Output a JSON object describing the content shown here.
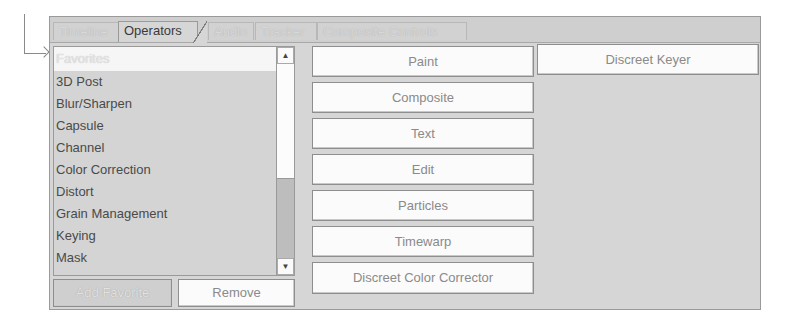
{
  "tabs": [
    {
      "label": "Timeline",
      "active": false
    },
    {
      "label": "Operators",
      "active": true
    },
    {
      "label": "Audio",
      "active": false
    },
    {
      "label": "Tracker",
      "active": false
    },
    {
      "label": "Composite Controls",
      "active": false
    }
  ],
  "category_list": {
    "header": "Favorites",
    "items": [
      "3D Post",
      "Blur/Sharpen",
      "Capsule",
      "Channel",
      "Color Correction",
      "Distort",
      "Grain Management",
      "Keying",
      "Mask"
    ]
  },
  "list_buttons": {
    "add_favorite": "Add Favorite",
    "remove": "Remove"
  },
  "operator_buttons": {
    "column1": [
      "Paint",
      "Composite",
      "Text",
      "Edit",
      "Particles",
      "Timewarp",
      "Discreet Color Corrector"
    ],
    "column2": [
      "Discreet Keyer"
    ]
  },
  "scrollbar": {
    "up_icon": "▲",
    "down_icon": "▼"
  }
}
